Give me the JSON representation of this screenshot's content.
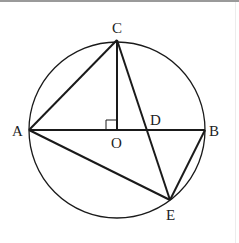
{
  "diagram": {
    "type": "geometry-circle",
    "circle": {
      "center": "O",
      "cx": 117,
      "cy": 130,
      "r": 88
    },
    "points": {
      "A": {
        "label": "A",
        "x": 29,
        "y": 130
      },
      "B": {
        "label": "B",
        "x": 205,
        "y": 130
      },
      "C": {
        "label": "C",
        "x": 117,
        "y": 40
      },
      "O": {
        "label": "O",
        "x": 117,
        "y": 130
      },
      "D": {
        "label": "D",
        "x": 147,
        "y": 130
      },
      "E": {
        "label": "E",
        "x": 170,
        "y": 200
      }
    },
    "segments": [
      "AB",
      "AC",
      "CO",
      "CE",
      "AE",
      "BE"
    ],
    "annotations": {
      "right_angle_at": "O",
      "between": [
        "CO",
        "AO"
      ]
    },
    "colors": {
      "stroke": "#1a1a1a",
      "label": "#222222"
    }
  }
}
